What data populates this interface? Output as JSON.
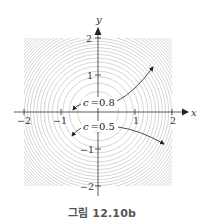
{
  "figure": {
    "caption": "그림 12.10b",
    "axes": {
      "x_label": "x",
      "y_label": "y",
      "x_ticks": [
        "−2",
        "−1",
        "1",
        "2"
      ],
      "y_ticks": [
        "2",
        "1",
        "−1",
        "−2"
      ]
    },
    "annotations": [
      {
        "label": "c = 0.8",
        "text": "c",
        "eq": "=",
        "value": "0.8"
      },
      {
        "label": "c = 0.5",
        "text": "c",
        "eq": "=",
        "value": "0.5"
      }
    ],
    "colors": {
      "contour": "#b8b8b8",
      "axis": "#333333",
      "corner_fill": "#e6e6e6",
      "caption": "#555555"
    }
  },
  "chart_data": {
    "type": "contour",
    "title": "그림 12.10b",
    "xlabel": "x",
    "ylabel": "y",
    "xlim": [
      -2,
      2
    ],
    "ylim": [
      -2,
      2
    ],
    "x_ticks": [
      -2,
      -1,
      1,
      2
    ],
    "y_ticks": [
      -2,
      -1,
      1,
      2
    ],
    "contour_shape": "concentric circles centered at origin",
    "labeled_levels": [
      0.8,
      0.5
    ],
    "annotations": [
      "c = 0.8",
      "c = 0.5"
    ]
  }
}
